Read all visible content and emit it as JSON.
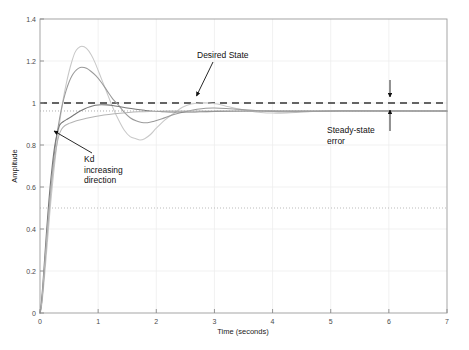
{
  "chart_data": {
    "type": "line",
    "title": "",
    "xlabel": "Time (seconds)",
    "ylabel": "Amplitude",
    "xlim": [
      0,
      7
    ],
    "ylim": [
      0,
      1.4
    ],
    "xticks": [
      0,
      1,
      2,
      3,
      4,
      5,
      6,
      7
    ],
    "yticks": [
      0,
      0.2,
      0.4,
      0.6,
      0.8,
      1,
      1.2,
      1.4
    ],
    "xtick_labels": [
      "0",
      "1",
      "2",
      "3",
      "4",
      "5",
      "6",
      "7"
    ],
    "ytick_labels": [
      "0",
      "0.2",
      "0.4",
      "0.6",
      "0.8",
      "1",
      "1.2",
      "1.4"
    ],
    "grid": true,
    "legend": "none",
    "series": [
      {
        "name": "Kd smallest",
        "color": "#c8c8c8",
        "overshoot": 1.27,
        "peak_time": 0.72,
        "steady_state": 0.962,
        "points": [
          [
            0,
            0
          ],
          [
            0.02,
            0.02
          ],
          [
            0.05,
            0.09
          ],
          [
            0.08,
            0.18
          ],
          [
            0.11,
            0.28
          ],
          [
            0.14,
            0.38
          ],
          [
            0.17,
            0.48
          ],
          [
            0.2,
            0.57
          ],
          [
            0.24,
            0.68
          ],
          [
            0.28,
            0.78
          ],
          [
            0.32,
            0.87
          ],
          [
            0.36,
            0.95
          ],
          [
            0.4,
            1.02
          ],
          [
            0.45,
            1.09
          ],
          [
            0.5,
            1.15
          ],
          [
            0.55,
            1.2
          ],
          [
            0.6,
            1.24
          ],
          [
            0.65,
            1.26
          ],
          [
            0.72,
            1.27
          ],
          [
            0.8,
            1.26
          ],
          [
            0.88,
            1.23
          ],
          [
            0.95,
            1.19
          ],
          [
            1.05,
            1.12
          ],
          [
            1.15,
            1.05
          ],
          [
            1.25,
            0.98
          ],
          [
            1.35,
            0.92
          ],
          [
            1.45,
            0.87
          ],
          [
            1.55,
            0.84
          ],
          [
            1.65,
            0.83
          ],
          [
            1.72,
            0.824
          ],
          [
            1.8,
            0.83
          ],
          [
            1.9,
            0.85
          ],
          [
            2.0,
            0.88
          ],
          [
            2.15,
            0.92
          ],
          [
            2.3,
            0.95
          ],
          [
            2.45,
            0.98
          ],
          [
            2.6,
            0.995
          ],
          [
            2.75,
            1.0
          ],
          [
            2.9,
            1.0
          ],
          [
            3.05,
            0.995
          ],
          [
            3.2,
            0.985
          ],
          [
            3.4,
            0.972
          ],
          [
            3.6,
            0.962
          ],
          [
            3.8,
            0.955
          ],
          [
            4.0,
            0.952
          ],
          [
            4.25,
            0.953
          ],
          [
            4.5,
            0.957
          ],
          [
            4.8,
            0.961
          ],
          [
            5.1,
            0.964
          ],
          [
            5.5,
            0.964
          ],
          [
            6.0,
            0.963
          ],
          [
            6.5,
            0.962
          ],
          [
            7.0,
            0.962
          ]
        ]
      },
      {
        "name": "Kd small",
        "color": "#9a9a9a",
        "overshoot": 1.17,
        "peak_time": 0.72,
        "steady_state": 0.962,
        "points": [
          [
            0,
            0
          ],
          [
            0.02,
            0.03
          ],
          [
            0.05,
            0.11
          ],
          [
            0.08,
            0.22
          ],
          [
            0.11,
            0.33
          ],
          [
            0.14,
            0.44
          ],
          [
            0.17,
            0.54
          ],
          [
            0.2,
            0.63
          ],
          [
            0.24,
            0.74
          ],
          [
            0.28,
            0.83
          ],
          [
            0.32,
            0.9
          ],
          [
            0.36,
            0.96
          ],
          [
            0.4,
            1.01
          ],
          [
            0.45,
            1.06
          ],
          [
            0.5,
            1.1
          ],
          [
            0.55,
            1.13
          ],
          [
            0.6,
            1.15
          ],
          [
            0.66,
            1.165
          ],
          [
            0.72,
            1.17
          ],
          [
            0.8,
            1.165
          ],
          [
            0.88,
            1.15
          ],
          [
            0.96,
            1.13
          ],
          [
            1.05,
            1.1
          ],
          [
            1.15,
            1.06
          ],
          [
            1.25,
            1.02
          ],
          [
            1.35,
            0.99
          ],
          [
            1.45,
            0.955
          ],
          [
            1.55,
            0.93
          ],
          [
            1.65,
            0.915
          ],
          [
            1.75,
            0.907
          ],
          [
            1.85,
            0.906
          ],
          [
            1.95,
            0.912
          ],
          [
            2.1,
            0.925
          ],
          [
            2.25,
            0.94
          ],
          [
            2.4,
            0.952
          ],
          [
            2.55,
            0.962
          ],
          [
            2.7,
            0.97
          ],
          [
            2.85,
            0.975
          ],
          [
            3.0,
            0.976
          ],
          [
            3.2,
            0.974
          ],
          [
            3.4,
            0.97
          ],
          [
            3.6,
            0.966
          ],
          [
            3.85,
            0.962
          ],
          [
            4.1,
            0.959
          ],
          [
            4.4,
            0.959
          ],
          [
            4.8,
            0.96
          ],
          [
            5.2,
            0.962
          ],
          [
            5.7,
            0.962
          ],
          [
            6.2,
            0.962
          ],
          [
            7.0,
            0.962
          ]
        ]
      },
      {
        "name": "Kd large",
        "color": "#777777",
        "overshoot": 0.992,
        "peak_time": 1.05,
        "steady_state": 0.962,
        "points": [
          [
            0,
            0
          ],
          [
            0.02,
            0.04
          ],
          [
            0.05,
            0.14
          ],
          [
            0.08,
            0.26
          ],
          [
            0.11,
            0.38
          ],
          [
            0.14,
            0.49
          ],
          [
            0.17,
            0.59
          ],
          [
            0.21,
            0.7
          ],
          [
            0.25,
            0.79
          ],
          [
            0.29,
            0.85
          ],
          [
            0.33,
            0.89
          ],
          [
            0.37,
            0.905
          ],
          [
            0.42,
            0.915
          ],
          [
            0.48,
            0.925
          ],
          [
            0.55,
            0.937
          ],
          [
            0.62,
            0.95
          ],
          [
            0.7,
            0.963
          ],
          [
            0.78,
            0.974
          ],
          [
            0.86,
            0.982
          ],
          [
            0.95,
            0.989
          ],
          [
            1.05,
            0.992
          ],
          [
            1.15,
            0.991
          ],
          [
            1.25,
            0.988
          ],
          [
            1.38,
            0.982
          ],
          [
            1.5,
            0.976
          ],
          [
            1.65,
            0.97
          ],
          [
            1.8,
            0.965
          ],
          [
            1.95,
            0.961
          ],
          [
            2.1,
            0.959
          ],
          [
            2.3,
            0.957
          ],
          [
            2.5,
            0.957
          ],
          [
            2.75,
            0.958
          ],
          [
            3.0,
            0.96
          ],
          [
            3.3,
            0.961
          ],
          [
            3.7,
            0.962
          ],
          [
            4.2,
            0.962
          ],
          [
            5.0,
            0.962
          ],
          [
            6.0,
            0.962
          ],
          [
            7.0,
            0.962
          ]
        ]
      },
      {
        "name": "Kd largest",
        "color": "#b4b4b4",
        "overshoot": 0.963,
        "peak_time": 2.2,
        "steady_state": 0.962,
        "points": [
          [
            0,
            0
          ],
          [
            0.03,
            0.05
          ],
          [
            0.06,
            0.16
          ],
          [
            0.1,
            0.3
          ],
          [
            0.14,
            0.44
          ],
          [
            0.18,
            0.56
          ],
          [
            0.22,
            0.67
          ],
          [
            0.27,
            0.77
          ],
          [
            0.32,
            0.84
          ],
          [
            0.37,
            0.875
          ],
          [
            0.43,
            0.893
          ],
          [
            0.5,
            0.903
          ],
          [
            0.58,
            0.911
          ],
          [
            0.68,
            0.919
          ],
          [
            0.8,
            0.927
          ],
          [
            0.95,
            0.936
          ],
          [
            1.1,
            0.943
          ],
          [
            1.28,
            0.949
          ],
          [
            1.48,
            0.954
          ],
          [
            1.7,
            0.958
          ],
          [
            1.95,
            0.96
          ],
          [
            2.2,
            0.9615
          ],
          [
            2.5,
            0.962
          ],
          [
            2.9,
            0.962
          ],
          [
            3.4,
            0.962
          ],
          [
            4.0,
            0.962
          ],
          [
            5.0,
            0.962
          ],
          [
            6.0,
            0.962
          ],
          [
            7.0,
            0.962
          ]
        ]
      }
    ],
    "reference_lines": [
      {
        "name": "desired-state-line",
        "y": 1.0,
        "style": "dashed",
        "color": "#333333"
      },
      {
        "name": "steady-state-dotted-line",
        "y": 0.962,
        "style": "dotted",
        "color": "#999999"
      },
      {
        "name": "half-amplitude-dotted-line",
        "y": 0.5,
        "style": "dotted",
        "color": "#aaaaaa"
      }
    ],
    "annotations": [
      {
        "name": "desired-state",
        "text": "Desired State",
        "target_x": 2.7,
        "target_y": 1.0
      },
      {
        "name": "kd-increasing",
        "text": "Kd\nincreasing\ndirection",
        "target_x": 0.22,
        "target_y": 0.83
      },
      {
        "name": "steady-state-error",
        "text": "Steady-state\nerror",
        "target_x": 6.05,
        "target_y": 0.98
      }
    ]
  },
  "annotations": {
    "desired_state": "Desired State",
    "kd_line1": "Kd",
    "kd_line2": "increasing",
    "kd_line3": "direction",
    "sse_line1": "Steady-state",
    "sse_line2": "error"
  },
  "axes": {
    "xlabel": "Time (seconds)",
    "ylabel": "Amplitude"
  }
}
